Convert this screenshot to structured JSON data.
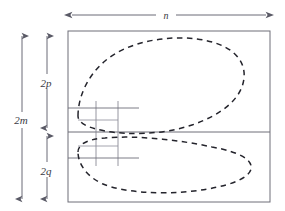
{
  "figure": {
    "type": "technical-diagram",
    "background_color": "#ffffff",
    "line_color": "#5a5a66",
    "dash_color": "#2b2b33",
    "grid_color": "#7c7c88"
  },
  "dimensions": {
    "width_label": "n",
    "total_height_label": "2m",
    "upper_band_label": "2p",
    "lower_band_label": "2q"
  },
  "labels": [
    {
      "name": "width-label",
      "text": "n",
      "x": 166,
      "y": 18,
      "anchor": "middle"
    },
    {
      "name": "total-height-label",
      "text": "2m",
      "x": 20,
      "y": 122,
      "anchor": "middle"
    },
    {
      "name": "upper-band-label",
      "text": "2p",
      "x": 47,
      "y": 85,
      "anchor": "middle"
    },
    {
      "name": "lower-band-label",
      "text": "2q",
      "x": 47,
      "y": 173,
      "anchor": "middle"
    }
  ],
  "frame": {
    "name": "outer-rectangle",
    "x": 68,
    "y": 31,
    "width": 202,
    "height": 171,
    "divider_y": 132
  },
  "arrows": {
    "width_arrow": {
      "name": "width-dimension-arrow",
      "y": 15,
      "x1": 70,
      "x2": 268,
      "orientation": "horizontal",
      "label": "n"
    },
    "height_arrow": {
      "name": "height-dimension-arrow",
      "x": 22,
      "y1": 33,
      "y2": 200,
      "orientation": "vertical",
      "label": "2m"
    },
    "upper_arrow": {
      "name": "upper-band-arrow",
      "x": 47,
      "y1": 33,
      "y2": 130,
      "orientation": "vertical",
      "label": "2p"
    },
    "lower_arrow": {
      "name": "lower-band-arrow",
      "x": 47,
      "y1": 134,
      "y2": 200,
      "orientation": "vertical",
      "label": "2q"
    }
  },
  "grid": {
    "name": "inner-grid",
    "vertical_lines_x": [
      96,
      118
    ],
    "vertical_extent": [
      101,
      166
    ],
    "horizontal_lines": [
      {
        "y": 108,
        "x1": 68,
        "x2": 139
      },
      {
        "y": 158,
        "x1": 68,
        "x2": 139
      }
    ],
    "stub_lines": [
      {
        "y": 120,
        "x1": 76,
        "x2": 117
      },
      {
        "y": 146,
        "x1": 76,
        "x2": 117
      }
    ]
  },
  "curves": [
    {
      "name": "upper-dashed-contour",
      "style": "dashed",
      "shape": "rounded oval / teardrop, wide lobe to the right, pinched at left near the grid",
      "path": "M 80 114 C 80 98 86 76 104 60 C 126 41 166 36 196 40 C 228 44 245 58 243 78 C 241 98 222 114 194 124 C 164 134 130 134 106 130 C 90 127 80 122 80 114 Z"
    },
    {
      "name": "lower-dashed-contour",
      "style": "dashed",
      "shape": "flattened elongated oval, narrow tip at left, long lobe extending right",
      "path": "M 80 150 C 80 143 88 139 104 138 C 134 136 178 140 210 146 C 238 151 252 159 250 168 C 248 178 228 186 196 190 C 160 194 124 192 104 184 C 88 177 80 163 80 150 Z"
    }
  ],
  "leader_marks": [
    {
      "name": "upper-pinch-mark",
      "x": 77,
      "y1": 100,
      "y2": 128
    },
    {
      "name": "lower-pinch-mark",
      "x": 77,
      "y1": 140,
      "y2": 172
    }
  ]
}
